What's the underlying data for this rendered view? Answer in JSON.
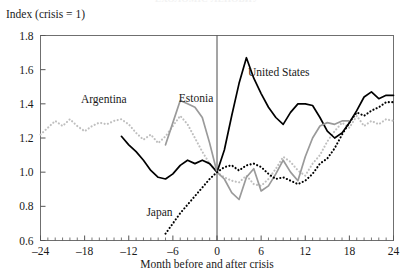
{
  "figure": {
    "cropped_header": "ЕХОЛОМІС ЛЕПОВИУ",
    "y_axis_caption": "Index (crisis = 1)",
    "x_axis_caption": "Month before and after crisis"
  },
  "chart_data": {
    "type": "line",
    "title": "",
    "subtitle": "",
    "xlabel": "Month before and after crisis",
    "ylabel": "Index (crisis = 1)",
    "xlim": [
      -24,
      24
    ],
    "ylim": [
      0.6,
      1.8
    ],
    "xticks": [
      -24,
      -18,
      -12,
      -6,
      0,
      6,
      12,
      18,
      24
    ],
    "xtick_labels": [
      "–24",
      "–18",
      "–12",
      "–6",
      "0",
      "6",
      "12",
      "18",
      "24"
    ],
    "yticks": [
      0.6,
      0.8,
      1.0,
      1.2,
      1.4,
      1.6,
      1.8
    ],
    "ytick_labels": [
      "0.6",
      "0.8",
      "1.0",
      "1.2",
      "1.4",
      "1.6",
      "1.8"
    ],
    "minor_xtick_interval": 1,
    "grid": false,
    "legend_position": "inline-annotations",
    "annotations": [
      {
        "text": "Argentina",
        "x": -18.5,
        "y": 1.405
      },
      {
        "text": "Estonia",
        "x": -5.2,
        "y": 1.41
      },
      {
        "text": "United States",
        "x": 4.2,
        "y": 1.565
      },
      {
        "text": "Japan",
        "x": -9.6,
        "y": 0.745
      }
    ],
    "reference_lines": [
      {
        "type": "vertical",
        "x": 0,
        "label": "crisis month"
      }
    ],
    "series": [
      {
        "name": "Argentina",
        "color": "#bfbfbf",
        "style": "dotted",
        "x": [
          -24,
          -23,
          -22,
          -21,
          -20,
          -19,
          -18,
          -17,
          -16,
          -15,
          -14,
          -13,
          -12,
          -11,
          -10,
          -9,
          -8,
          -7,
          -6,
          -5,
          -4,
          -3,
          -2,
          -1,
          0,
          1,
          2,
          3,
          4,
          5,
          6,
          7,
          8,
          9,
          10,
          11,
          12,
          13,
          14,
          15,
          16,
          17,
          18,
          19,
          20,
          21,
          22,
          23,
          24
        ],
        "values": [
          1.22,
          1.26,
          1.3,
          1.27,
          1.31,
          1.27,
          1.24,
          1.27,
          1.29,
          1.28,
          1.3,
          1.31,
          1.28,
          1.23,
          1.19,
          1.22,
          1.17,
          1.21,
          1.27,
          1.33,
          1.28,
          1.2,
          1.12,
          1.05,
          1.0,
          0.97,
          0.95,
          0.94,
          0.98,
          0.93,
          0.92,
          0.96,
          1.02,
          1.09,
          1.06,
          1.01,
          0.98,
          1.05,
          1.1,
          1.18,
          1.24,
          1.29,
          1.26,
          1.33,
          1.27,
          1.3,
          1.28,
          1.31,
          1.3
        ]
      },
      {
        "name": "United States",
        "color": "#000000",
        "style": "solid",
        "x": [
          -13,
          -12,
          -11,
          -10,
          -9,
          -8,
          -7,
          -6,
          -5,
          -4,
          -3,
          -2,
          -1,
          0,
          1,
          2,
          3,
          4,
          5,
          6,
          7,
          8,
          9,
          10,
          11,
          12,
          13,
          14,
          15,
          16,
          17,
          18,
          19,
          20,
          21,
          22,
          23,
          24
        ],
        "values": [
          1.21,
          1.16,
          1.12,
          1.07,
          1.01,
          0.97,
          0.96,
          0.99,
          1.04,
          1.07,
          1.05,
          1.07,
          1.05,
          1.0,
          1.13,
          1.33,
          1.52,
          1.67,
          1.55,
          1.46,
          1.38,
          1.32,
          1.28,
          1.35,
          1.4,
          1.4,
          1.39,
          1.32,
          1.24,
          1.2,
          1.23,
          1.29,
          1.36,
          1.44,
          1.47,
          1.43,
          1.45,
          1.45
        ]
      },
      {
        "name": "Estonia",
        "color": "#9a9a9a",
        "style": "solid",
        "x": [
          -7,
          -6,
          -5,
          -4,
          -3,
          -2,
          -1,
          0,
          1,
          2,
          3,
          4,
          5,
          6,
          7,
          8,
          9,
          10,
          11,
          12,
          13,
          14,
          15,
          16,
          17,
          18
        ],
        "values": [
          1.16,
          1.29,
          1.42,
          1.4,
          1.38,
          1.32,
          1.17,
          1.0,
          0.96,
          0.88,
          0.84,
          0.97,
          1.02,
          0.89,
          0.92,
          0.99,
          1.07,
          1.0,
          0.95,
          1.09,
          1.2,
          1.27,
          1.29,
          1.28,
          1.3,
          1.3
        ]
      },
      {
        "name": "Japan",
        "color": "#000000",
        "style": "dotted",
        "x": [
          -7,
          -6,
          -5,
          -4,
          -3,
          -2,
          -1,
          0,
          1,
          2,
          3,
          4,
          5,
          6,
          7,
          8,
          9,
          10,
          11,
          12,
          13,
          14,
          15,
          16,
          17,
          18,
          19,
          20,
          21,
          22,
          23,
          24
        ],
        "values": [
          0.64,
          0.7,
          0.76,
          0.81,
          0.86,
          0.91,
          0.96,
          1.0,
          1.03,
          1.04,
          1.01,
          1.04,
          1.05,
          1.03,
          0.99,
          0.96,
          0.97,
          0.95,
          0.93,
          0.95,
          0.99,
          1.05,
          1.08,
          1.14,
          1.22,
          1.29,
          1.35,
          1.33,
          1.36,
          1.38,
          1.41,
          1.41
        ]
      }
    ]
  }
}
